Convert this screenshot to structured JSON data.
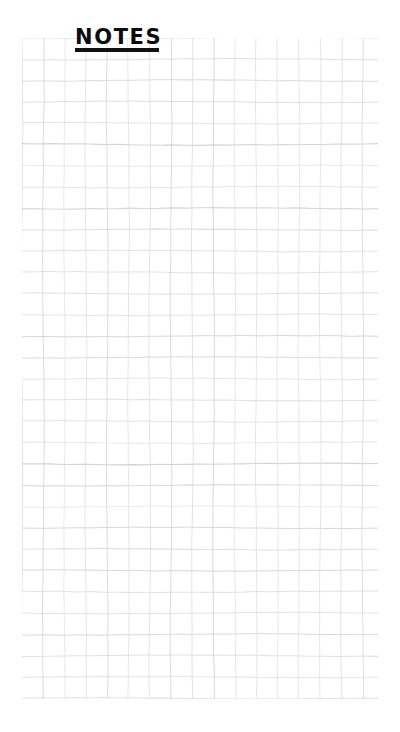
{
  "page": {
    "kind": "grid-notepad-page",
    "background_color": "#ffffff",
    "width": 400,
    "height": 732
  },
  "heading": {
    "text": "NOTES",
    "style": "hand-lettered-marker-capitals",
    "color": "#0c0c0c",
    "underline": true,
    "underline_color": "#111111",
    "left": 76,
    "top": 40,
    "underline_y": 61,
    "underline_width": 84,
    "underline_thickness": 4
  },
  "grid": {
    "name": "graph-paper-grid",
    "line_color": "#dcdcdc",
    "line_color_strong": "#cfcfcf",
    "cell_size": 21.3,
    "columns": 17,
    "rows": 31,
    "left": 22,
    "top": 38,
    "width": 356,
    "height": 661,
    "hand_drawn": true,
    "line_width": 1.0
  },
  "content": {
    "body_text": "",
    "note_lines": [],
    "is_blank": true
  }
}
